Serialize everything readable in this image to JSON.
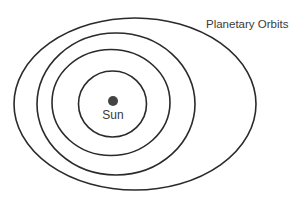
{
  "title": "Planetary Orbits",
  "sun": {
    "label": "Sun",
    "cx": 113,
    "cy": 101,
    "r": 5,
    "color": "#444444"
  },
  "orbits": [
    {
      "name": "outer-orbit",
      "cx": 135,
      "cy": 104,
      "rx": 121,
      "ry": 86
    },
    {
      "name": "orbit-3",
      "cx": 116,
      "cy": 104,
      "rx": 79,
      "ry": 71
    },
    {
      "name": "orbit-2",
      "cx": 111,
      "cy": 102.5,
      "rx": 59,
      "ry": 53
    },
    {
      "name": "inner-orbit",
      "cx": 112.5,
      "cy": 104,
      "rx": 34,
      "ry": 33
    }
  ],
  "colors": {
    "stroke": "#2a2a2a",
    "text": "#3a3a3a",
    "background": "#ffffff"
  }
}
